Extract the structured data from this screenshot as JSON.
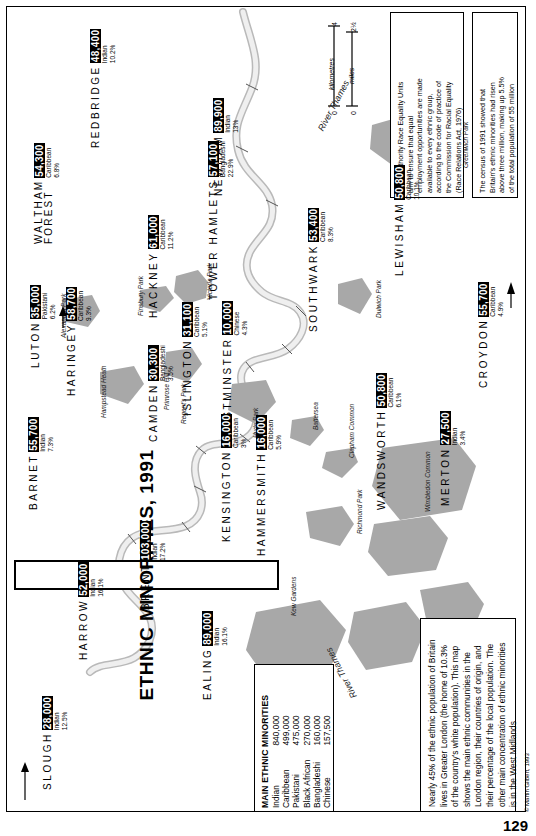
{
  "page": {
    "number": "129",
    "credit": "© Martin Gilbert, 1993"
  },
  "title": "ETHNIC MINORITIES, 1991",
  "scale": {
    "km_label": "kilometres",
    "km_min": "0",
    "km_max": "4",
    "mi_label": "miles",
    "mi_min": "0",
    "mi_max": "2½"
  },
  "notes": [
    {
      "id": "race-equality-units",
      "lines": [
        "Local authority Race Equality Units",
        "aim to ensure that equal",
        "employment opportunities are made",
        "available to every ethnic group,",
        "according to the code of practice of",
        "the Commission for Racial Equality",
        "(Race Relations Act, 1976)"
      ]
    },
    {
      "id": "census-1991",
      "lines": [
        "The census of 1991 showed that",
        "Britain's ethnic minorities had risen",
        "above three million, making up 5.5%",
        "of the total population of 55 million"
      ]
    }
  ],
  "legend": {
    "heading": "MAIN ETHNIC MINORITIES",
    "rows": [
      {
        "group": "Indian",
        "value": "840,000"
      },
      {
        "group": "Caribbean",
        "value": "499,000"
      },
      {
        "group": "Pakistani",
        "value": "475,000"
      },
      {
        "group": "Black African",
        "value": "270,000"
      },
      {
        "group": "Bangladeshi",
        "value": "160,000"
      },
      {
        "group": "Chinese",
        "value": "157,500"
      }
    ]
  },
  "paragraph": {
    "lines": [
      "Nearly 45% of the ethnic population of Britain",
      "lives in Greater London (the home of 10.3%",
      "of the country's white population). This map",
      "shows the main ethnic communities in the",
      "London region, their countries of origin, and",
      "their percentage of the local population. The",
      "other main concentration of ethnic minorities",
      "is in the West Midlands"
    ]
  },
  "river": {
    "upper_label": "River Thames",
    "lower_label": "River Thames"
  },
  "boroughs": [
    {
      "name": "SLOUGH",
      "lines": [
        "SLOUGH"
      ],
      "count": "28,000",
      "group": "Indian",
      "pct": "12.5%"
    },
    {
      "name": "HARROW",
      "lines": [
        "HARROW"
      ],
      "count": "52,000",
      "group": "Indian",
      "pct": "16.1%"
    },
    {
      "name": "BRENT",
      "lines": [
        "BRENT"
      ],
      "count": "103,000",
      "group": "Indian",
      "pct": "17.2%"
    },
    {
      "name": "EALING",
      "lines": [
        "EALING"
      ],
      "count": "89,000",
      "group": "Indian",
      "pct": "16.1%"
    },
    {
      "name": "BARNET",
      "lines": [
        "BARNET"
      ],
      "count": "55,700",
      "group": "Indian",
      "pct": "7.3%"
    },
    {
      "name": "LUTON",
      "lines": [
        "LUTON"
      ],
      "count": "35,000",
      "group": "Pakistani",
      "pct": "6.2%"
    },
    {
      "name": "HARINGEY",
      "lines": [
        "HARINGEY"
      ],
      "count": "58,700",
      "group": "Caribbean",
      "pct": "9.3%"
    },
    {
      "name": "WALTHAM FOREST",
      "lines": [
        "WALTHAM",
        "FOREST"
      ],
      "count": "54,300",
      "group": "Caribbean",
      "pct": "6.8%"
    },
    {
      "name": "REDBRIDGE",
      "lines": [
        "REDBRIDGE"
      ],
      "count": "48,400",
      "group": "Indian",
      "pct": "10.2%"
    },
    {
      "name": "HACKNEY",
      "lines": [
        "HACKNEY"
      ],
      "count": "61,000",
      "group": "Caribbean",
      "pct": "11.2%"
    },
    {
      "name": "NEWHAM",
      "lines": [
        "NEWHAM"
      ],
      "count": "89,900",
      "group": "Indian",
      "pct": "13%"
    },
    {
      "name": "TOWER HAMLETS",
      "lines": [
        "TOWER HAMLETS"
      ],
      "count": "57,100",
      "group": "Bangladeshi",
      "pct": "22.9%"
    },
    {
      "name": "CAMDEN",
      "lines": [
        "CAMDEN"
      ],
      "count": "30,300",
      "group": "Bangladeshi",
      "pct": "3.5%"
    },
    {
      "name": "ISLINGTON",
      "lines": [
        "ISLINGTON"
      ],
      "count": "31,100",
      "group": "Caribbean",
      "pct": "5.1%"
    },
    {
      "name": "WESTMINSTER",
      "lines": [
        "WESTMINSTER"
      ],
      "count": "10,000",
      "group": "Chinese",
      "pct": "4.3%"
    },
    {
      "name": "KENSINGTON",
      "lines": [
        "KENSINGTON"
      ],
      "count": "16,000",
      "group": "Caribbean",
      "pct": "3%"
    },
    {
      "name": "HAMMERSMITH",
      "lines": [
        "HAMMERSMITH"
      ],
      "count": "16,000",
      "group": "Caribbean",
      "pct": "5.9%"
    },
    {
      "name": "SOUTHWARK",
      "lines": [
        "SOUTHWARK"
      ],
      "count": "53,400",
      "group": "Caribbean",
      "pct": "8.3%"
    },
    {
      "name": "LEWISHAM",
      "lines": [
        "LEWISHAM"
      ],
      "count": "50,800",
      "group": "Caribbean",
      "pct": "10.1%"
    },
    {
      "name": "WANDSWORTH",
      "lines": [
        "WANDSWORTH"
      ],
      "count": "50,800",
      "group": "Caribbean",
      "pct": "6.1%"
    },
    {
      "name": "MERTON",
      "lines": [
        "MERTON"
      ],
      "count": "27,500",
      "group": "Indian",
      "pct": "3.4%"
    },
    {
      "name": "CROYDON",
      "lines": [
        "CROYDON"
      ],
      "count": "55,700",
      "group": "Caribbean",
      "pct": "4.9%"
    }
  ],
  "parks": [
    {
      "label": "Greenwich Park"
    },
    {
      "label": "Victoria Park"
    },
    {
      "label": "Finsbury Park"
    },
    {
      "label": "Alexandra Park"
    },
    {
      "label": "Hampstead Heath"
    },
    {
      "label": "Primrose Hill"
    },
    {
      "label": "Regent's Park"
    },
    {
      "label": "Hyde Park"
    },
    {
      "label": "Dulwich Park"
    },
    {
      "label": "Battersea"
    },
    {
      "label": "Clapham Common"
    },
    {
      "label": "Richmond Park"
    },
    {
      "label": "Wimbledon Common"
    },
    {
      "label": "Kew Gardens"
    }
  ],
  "colors": {
    "land": "#a8a8a8",
    "river": "#d8d8d8",
    "ink": "#000000",
    "paper": "#ffffff"
  }
}
